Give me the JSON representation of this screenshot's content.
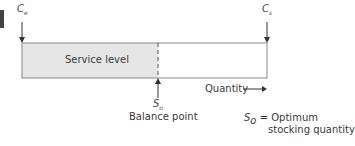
{
  "diagram": {
    "left_label": {
      "main": "C",
      "sub": "e"
    },
    "right_label": {
      "main": "C",
      "sub": "s"
    },
    "shaded_label": "Service level",
    "balance_symbol": {
      "main": "S",
      "sub": "o"
    },
    "balance_label": "Balance point",
    "axis_label": "Quantity",
    "legend": {
      "symbol_main": "S",
      "symbol_sub": "o",
      "line1": "= Optimum",
      "line2": "stocking quantity"
    },
    "colors": {
      "shade": "#e6e6e6",
      "line": "#777777",
      "marker": "#333333"
    }
  }
}
